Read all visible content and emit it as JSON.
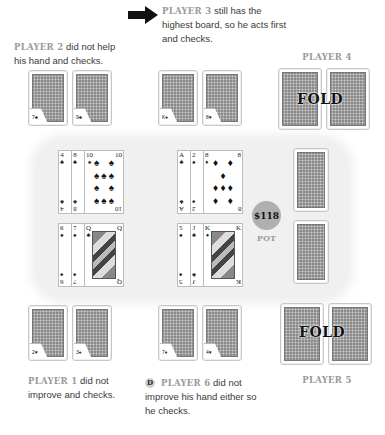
{
  "players": {
    "p2": {
      "name": "PLAYER 2",
      "caption": " did not help his hand and checks.",
      "peel_marks": [
        "7♣",
        "9♣"
      ]
    },
    "p3": {
      "name": "PLAYER 3",
      "caption": " still has the highest board, so he acts first and checks.",
      "peel_marks": [
        "K♠",
        "8♥"
      ]
    },
    "p4": {
      "name": "PLAYER 4",
      "status": "FOLD"
    },
    "p1": {
      "name": "PLAYER 1",
      "caption": " did not improve and checks.",
      "peel_marks": [
        "2♥",
        "3♠"
      ]
    },
    "p6": {
      "name": "PLAYER 6",
      "caption": " did not improve his hand either so he checks.",
      "dealer_button": "D",
      "peel_marks": [
        "7♦",
        "4♥"
      ]
    },
    "p5": {
      "name": "PLAYER 5",
      "status": "FOLD"
    }
  },
  "table": {
    "hands": [
      {
        "id": "p2-board",
        "cards": [
          {
            "rank": "4",
            "suit": "♣"
          },
          {
            "rank": "8",
            "suit": "♣"
          },
          {
            "rank": "10",
            "suit": "♠"
          }
        ]
      },
      {
        "id": "p3-board",
        "cards": [
          {
            "rank": "A",
            "suit": "♣"
          },
          {
            "rank": "2",
            "suit": "♠"
          },
          {
            "rank": "8",
            "suit": "♦"
          }
        ]
      },
      {
        "id": "p1-board",
        "cards": [
          {
            "rank": "6",
            "suit": "♠"
          },
          {
            "rank": "7",
            "suit": "♠"
          },
          {
            "rank": "Q",
            "suit": "♣"
          }
        ]
      },
      {
        "id": "p6-board",
        "cards": [
          {
            "rank": "5",
            "suit": "♠"
          },
          {
            "rank": "J",
            "suit": "♣"
          },
          {
            "rank": "K",
            "suit": "♦"
          }
        ]
      }
    ],
    "pot": {
      "amount": "$118",
      "label": "POT"
    }
  }
}
